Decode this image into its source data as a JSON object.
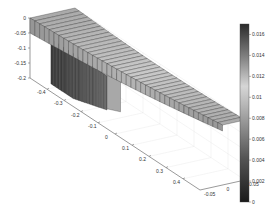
{
  "chart_data": {
    "type": "surface",
    "title": "",
    "xlabel": "",
    "ylabel": "",
    "zlabel": "",
    "x_ticks": [
      -0.4,
      -0.3,
      -0.2,
      -0.1,
      0,
      0.1,
      0.2,
      0.3,
      0.4
    ],
    "x_tick_labels": [
      "-0.4",
      "-0.3",
      "-0.2",
      "-0.1",
      "0",
      "0.1",
      "0.2",
      "0.3",
      "0.4"
    ],
    "y_ticks": [
      -0.05,
      0,
      0.05
    ],
    "y_tick_labels": [
      "-0.05",
      "0",
      "0.05"
    ],
    "z_ticks": [
      0,
      -0.05,
      -0.1,
      -0.15,
      -0.2
    ],
    "z_tick_labels": [
      "0",
      "-0.05",
      "-0.1",
      "-0.15",
      "-0.2"
    ],
    "xlim": [
      -0.5,
      0.5
    ],
    "ylim": [
      -0.05,
      0.05
    ],
    "zlim": [
      -0.2,
      0
    ],
    "grid": true,
    "colorbar": {
      "ticks": [
        0,
        0.002,
        0.004,
        0.006,
        0.008,
        0.01,
        0.012,
        0.014,
        0.016
      ],
      "tick_labels": [
        "0",
        "0.002",
        "0.004",
        "0.006",
        "0.008",
        "0.01",
        "0.012",
        "0.014",
        "0.016"
      ],
      "range": [
        0,
        0.017
      ],
      "colormap": "gray-dark-light-dark",
      "placement": "right"
    },
    "series": [
      {
        "name": "upper-sheet",
        "description": "thin curved mesh sheet spanning x -0.5..0.5 near z=0",
        "z_range": [
          -0.05,
          0
        ]
      },
      {
        "name": "lower-block",
        "description": "dense dark mesh block hanging below sheet near x -0.4..-0.1",
        "z_range": [
          -0.2,
          -0.05
        ]
      }
    ]
  }
}
